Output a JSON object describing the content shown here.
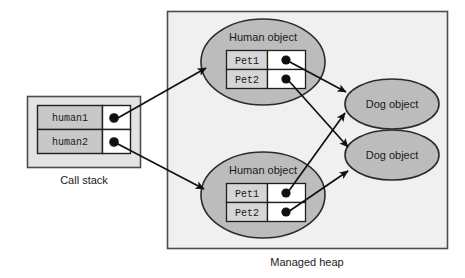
{
  "diagram": {
    "type": "object-reference-diagram",
    "colors": {
      "page_background": "#ffffff",
      "heap_fill": "#f0f0f0",
      "heap_stroke": "#4d4d4d",
      "stack_fill": "#e3e3e3",
      "stack_stroke": "#4d4d4d",
      "ellipse_fill": "#bcbcbc",
      "ellipse_stroke": "#2b2b2b",
      "label_cell_fill": "#c8c8c8",
      "pet_cell_fill": "#d6d6d6",
      "pointer_cell_fill": "#ffffff",
      "cell_stroke": "#1f1f1f",
      "dot_fill": "#111111",
      "arrow_stroke": "#111111",
      "text": "#1a1a1a"
    }
  },
  "call_stack": {
    "caption": "Call stack",
    "slots": [
      {
        "name": "human1",
        "pointer": "filled"
      },
      {
        "name": "human2",
        "pointer": "filled"
      }
    ]
  },
  "managed_heap": {
    "caption": "Managed heap",
    "human_objects": [
      {
        "label": "Human object",
        "fields": [
          {
            "name": "Pet1",
            "pointer": "filled"
          },
          {
            "name": "Pet2",
            "pointer": "filled"
          }
        ]
      },
      {
        "label": "Human object",
        "fields": [
          {
            "name": "Pet1",
            "pointer": "filled"
          },
          {
            "name": "Pet2",
            "pointer": "filled"
          }
        ]
      }
    ],
    "dog_objects": [
      {
        "label": "Dog object"
      },
      {
        "label": "Dog object"
      }
    ]
  },
  "references": [
    {
      "from": "call_stack.human1",
      "to": "human_object_top"
    },
    {
      "from": "call_stack.human2",
      "to": "human_object_bottom"
    },
    {
      "from": "human_object_top.Pet1",
      "to": "dog_object_top"
    },
    {
      "from": "human_object_top.Pet2",
      "to": "dog_object_bottom"
    },
    {
      "from": "human_object_bottom.Pet1",
      "to": "dog_object_top"
    },
    {
      "from": "human_object_bottom.Pet2",
      "to": "dog_object_bottom"
    }
  ]
}
